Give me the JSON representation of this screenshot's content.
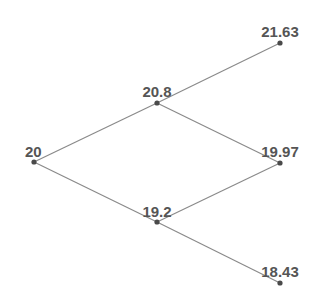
{
  "diagram": {
    "type": "binomial-tree",
    "steps": 2,
    "nodes": [
      {
        "id": "n0",
        "label": "20",
        "x": 34,
        "y": 162,
        "lx": 25,
        "ly": 157,
        "anchor": "start"
      },
      {
        "id": "n_u",
        "label": "20.8",
        "x": 157,
        "y": 103,
        "lx": 157,
        "ly": 97,
        "anchor": "middle"
      },
      {
        "id": "n_d",
        "label": "19.2",
        "x": 157,
        "y": 222,
        "lx": 157,
        "ly": 217,
        "anchor": "middle"
      },
      {
        "id": "n_uu",
        "label": "21.63",
        "x": 280,
        "y": 43,
        "lx": 280,
        "ly": 37,
        "anchor": "middle"
      },
      {
        "id": "n_ud",
        "label": "19.97",
        "x": 280,
        "y": 163,
        "lx": 280,
        "ly": 157,
        "anchor": "middle"
      },
      {
        "id": "n_dd",
        "label": "18.43",
        "x": 280,
        "y": 283,
        "lx": 280,
        "ly": 277,
        "anchor": "middle"
      }
    ],
    "edges": [
      {
        "from": "n0",
        "to": "n_u"
      },
      {
        "from": "n0",
        "to": "n_d"
      },
      {
        "from": "n_u",
        "to": "n_uu"
      },
      {
        "from": "n_u",
        "to": "n_ud"
      },
      {
        "from": "n_d",
        "to": "n_ud"
      },
      {
        "from": "n_d",
        "to": "n_dd"
      }
    ],
    "colors": {
      "edge": "#8a8a8a",
      "node": "#4a4a4a",
      "label": "#555555"
    }
  }
}
